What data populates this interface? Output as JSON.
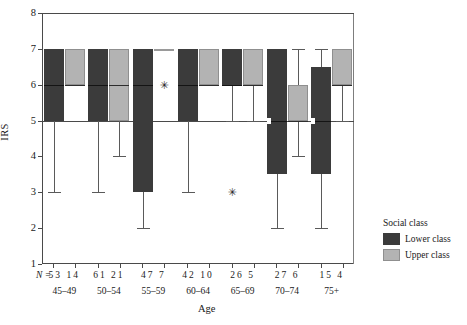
{
  "chart_data": {
    "type": "box",
    "title": "",
    "xlabel": "Age",
    "ylabel": "IRS",
    "ylim": [
      1,
      8
    ],
    "yticks": [
      1,
      2,
      3,
      4,
      5,
      6,
      7,
      8
    ],
    "ytick_labels": [
      "1",
      "2",
      "3",
      "4",
      "5",
      "6",
      "7",
      "8"
    ],
    "grid": false,
    "reference_lines": [
      5,
      8
    ],
    "legend_position": "right",
    "legend_title": "Social class",
    "n_row_label": "N =",
    "categories": [
      "45–49",
      "50–54",
      "55–59",
      "60–64",
      "65–69",
      "70–74",
      "75+"
    ],
    "series": [
      {
        "name": "Lower class",
        "color": "#3b3b3b",
        "boxes": [
          {
            "category": "45–49",
            "n": 53,
            "q1": 5.0,
            "median": 6.0,
            "q3": 7.0,
            "whisker_low": 3.0,
            "whisker_high": 7.0,
            "outliers": []
          },
          {
            "category": "50–54",
            "n": 61,
            "q1": 5.0,
            "median": 6.0,
            "q3": 7.0,
            "whisker_low": 3.0,
            "whisker_high": 7.0,
            "outliers": []
          },
          {
            "category": "55–59",
            "n": 47,
            "q1": 3.0,
            "median": 6.0,
            "q3": 7.0,
            "whisker_low": 2.0,
            "whisker_high": 7.0,
            "outliers": []
          },
          {
            "category": "60–64",
            "n": 42,
            "q1": 5.0,
            "median": 6.0,
            "q3": 7.0,
            "whisker_low": 3.0,
            "whisker_high": 7.0,
            "outliers": []
          },
          {
            "category": "65–69",
            "n": 26,
            "q1": 6.0,
            "median": 6.0,
            "q3": 7.0,
            "whisker_low": 5.0,
            "whisker_high": 7.0,
            "outliers": [
              3.0
            ]
          },
          {
            "category": "70–74",
            "n": 27,
            "q1": 3.5,
            "median": 5.0,
            "q3": 7.0,
            "whisker_low": 2.0,
            "whisker_high": 7.0,
            "outliers": []
          },
          {
            "category": "75+",
            "n": 15,
            "q1": 3.5,
            "median": 5.0,
            "q3": 6.5,
            "whisker_low": 2.0,
            "whisker_high": 7.0,
            "outliers": []
          }
        ]
      },
      {
        "name": "Upper class",
        "color": "#b3b3b3",
        "boxes": [
          {
            "category": "45–49",
            "n": 14,
            "q1": 6.0,
            "median": 6.0,
            "q3": 7.0,
            "whisker_low": 6.0,
            "whisker_high": 7.0,
            "outliers": []
          },
          {
            "category": "50–54",
            "n": 21,
            "q1": 5.0,
            "median": 6.0,
            "q3": 7.0,
            "whisker_low": 4.0,
            "whisker_high": 7.0,
            "outliers": []
          },
          {
            "category": "55–59",
            "n": 7,
            "q1": 7.0,
            "median": 7.0,
            "q3": 7.0,
            "whisker_low": 7.0,
            "whisker_high": 7.0,
            "outliers": [
              6.0
            ]
          },
          {
            "category": "60–64",
            "n": 10,
            "q1": 6.0,
            "median": 6.0,
            "q3": 7.0,
            "whisker_low": 6.0,
            "whisker_high": 7.0,
            "outliers": []
          },
          {
            "category": "65–69",
            "n": 5,
            "q1": 6.0,
            "median": 6.0,
            "q3": 7.0,
            "whisker_low": 5.0,
            "whisker_high": 7.0,
            "outliers": []
          },
          {
            "category": "70–74",
            "n": 6,
            "q1": 5.0,
            "median": 5.0,
            "q3": 6.0,
            "whisker_low": 4.0,
            "whisker_high": 7.0,
            "outliers": []
          },
          {
            "category": "75+",
            "n": 4,
            "q1": 6.0,
            "median": 6.0,
            "q3": 7.0,
            "whisker_low": 5.0,
            "whisker_high": 7.0,
            "outliers": []
          }
        ]
      }
    ]
  },
  "legend": {
    "title": "Social class",
    "items": [
      {
        "label": "Lower class",
        "color": "#3b3b3b"
      },
      {
        "label": "Upper class",
        "color": "#b3b3b3"
      }
    ]
  },
  "axes": {
    "y_title": "IRS",
    "x_title": "Age",
    "n_prefix": "N ="
  },
  "n_rows": [
    {
      "category": "45–49",
      "lower": "53",
      "upper": "14"
    },
    {
      "category": "50–54",
      "lower": "61",
      "upper": "21"
    },
    {
      "category": "55–59",
      "lower": "47",
      "upper": "7"
    },
    {
      "category": "60–64",
      "lower": "42",
      "upper": "10"
    },
    {
      "category": "65–69",
      "lower": "26",
      "upper": "5"
    },
    {
      "category": "70–74",
      "lower": "27",
      "upper": "6"
    },
    {
      "category": "75+",
      "lower": "15",
      "upper": "4"
    }
  ]
}
